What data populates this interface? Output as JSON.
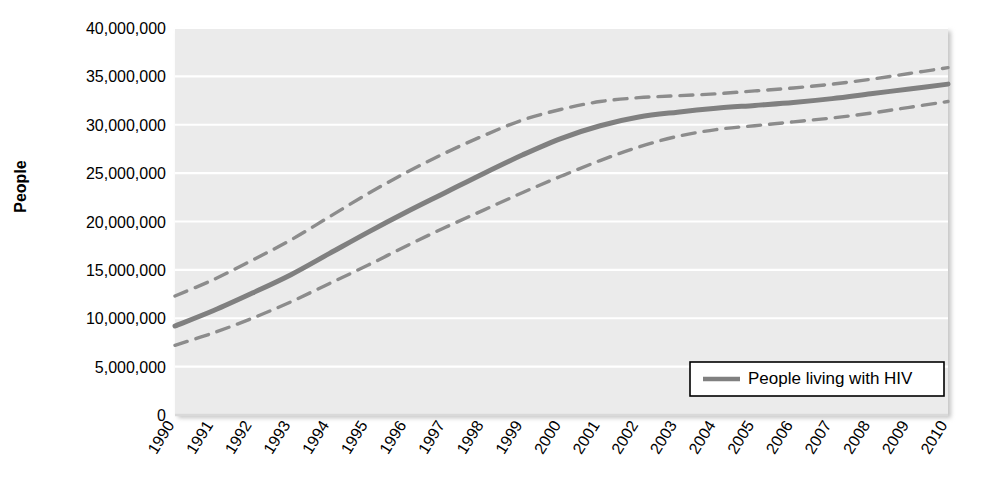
{
  "chart_data": {
    "type": "line",
    "title": "",
    "subtitle": "",
    "xlabel": "",
    "ylabel": "People",
    "xlim": [
      1990,
      2010
    ],
    "ylim": [
      0,
      40000000
    ],
    "ytick_values": [
      0,
      5000000,
      10000000,
      15000000,
      20000000,
      25000000,
      30000000,
      35000000,
      40000000
    ],
    "ytick_labels": [
      "0",
      "5,000,000",
      "10,000,000",
      "15,000,000",
      "20,000,000",
      "25,000,000",
      "30,000,000",
      "35,000,000",
      "40,000,000"
    ],
    "x": [
      1990,
      1991,
      1992,
      1993,
      1994,
      1995,
      1996,
      1997,
      1998,
      1999,
      2000,
      2001,
      2002,
      2003,
      2004,
      2005,
      2006,
      2007,
      2008,
      2009,
      2010
    ],
    "xtick_labels": [
      "1990",
      "1991",
      "1992",
      "1993",
      "1994",
      "1995",
      "1996",
      "1997",
      "1998",
      "1999",
      "2000",
      "2001",
      "2002",
      "2003",
      "2004",
      "2005",
      "2006",
      "2007",
      "2008",
      "2009",
      "2010"
    ],
    "grid": "horizontal",
    "grid_color": "#ffffff",
    "plot_background": "#ebebeb",
    "legend_position": "bottom-right",
    "series": [
      {
        "name": "People living with HIV",
        "style": "solid",
        "color": "#808080",
        "values": [
          9200000,
          10800000,
          12600000,
          14500000,
          16700000,
          18900000,
          21000000,
          23000000,
          25000000,
          26900000,
          28600000,
          29900000,
          30800000,
          31300000,
          31700000,
          32000000,
          32300000,
          32700000,
          33200000,
          33700000,
          34200000
        ]
      },
      {
        "name": "upper-bound",
        "style": "dashed",
        "color": "#8c8c8c",
        "values": [
          12300000,
          14000000,
          16000000,
          18100000,
          20500000,
          22900000,
          25100000,
          27100000,
          28900000,
          30500000,
          31600000,
          32400000,
          32800000,
          33000000,
          33200000,
          33500000,
          33800000,
          34200000,
          34700000,
          35300000,
          35900000
        ]
      },
      {
        "name": "lower-bound",
        "style": "dashed",
        "color": "#8c8c8c",
        "values": [
          7200000,
          8500000,
          10000000,
          11700000,
          13600000,
          15500000,
          17500000,
          19400000,
          21200000,
          23000000,
          24700000,
          26300000,
          27700000,
          28800000,
          29500000,
          29900000,
          30300000,
          30700000,
          31200000,
          31800000,
          32400000
        ]
      }
    ],
    "legend": [
      {
        "label": "People living with HIV",
        "color": "#808080",
        "style": "solid"
      }
    ]
  },
  "geometry": {
    "plot_left": 175,
    "plot_right": 948,
    "plot_top": 28,
    "plot_bottom": 415
  }
}
